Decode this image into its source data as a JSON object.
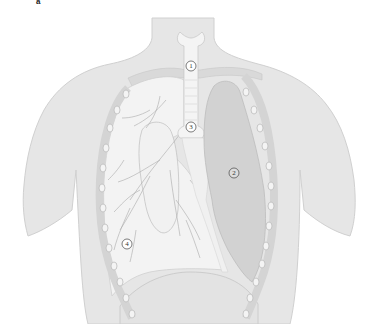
{
  "figure": {
    "corner_mark": "a",
    "labels": [
      {
        "id": "1",
        "text": "1",
        "x": 191,
        "y": 66
      },
      {
        "id": "2",
        "text": "2",
        "x": 234,
        "y": 173
      },
      {
        "id": "3",
        "text": "3",
        "x": 191,
        "y": 127
      },
      {
        "id": "4",
        "text": "4",
        "x": 127,
        "y": 244
      }
    ],
    "colors": {
      "body": "#e6e6e6",
      "body_outline": "#cfcfcf",
      "lung_right": "#f3f3f3",
      "lung_left_collapsed": "#d2d2d2",
      "trachea": "#f4f4f4",
      "ribs": "#f2f2f2",
      "rib_outline": "#bdbdbd",
      "diaphragm": "#dedede",
      "bronchi_lines": "#a9a9a9",
      "label_ring": "#444444"
    }
  }
}
